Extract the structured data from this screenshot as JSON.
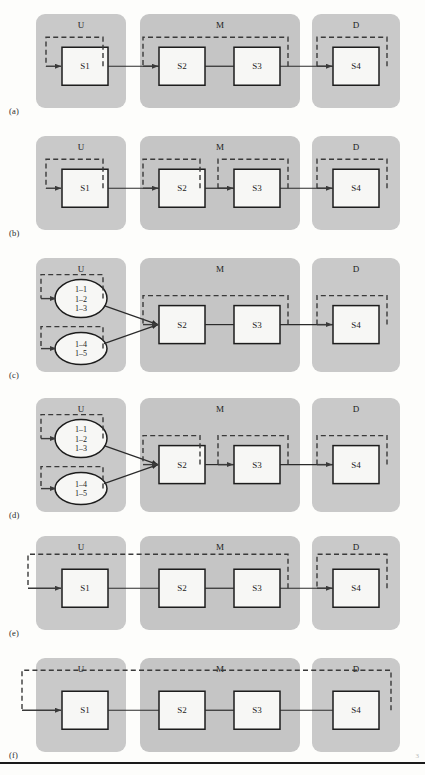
{
  "figure": {
    "width": 425,
    "height": 775,
    "stage_labels": [
      "U",
      "M",
      "D"
    ],
    "stage_label_names": {
      "U": "upstream",
      "M": "midstream",
      "D": "downstream"
    },
    "colors": {
      "stage_fill": "#c9c9c9",
      "stage_fill_alt": "#c5c5c5",
      "box_fill": "#f7f7f5",
      "box_stroke": "#1c1c1c",
      "dashed_stroke": "#3a3a3a",
      "flow_stroke": "#2b2b2b",
      "page_bg": "#fdfdfb",
      "text": "#222222"
    },
    "node_labels": [
      "S1",
      "S2",
      "S3",
      "S4"
    ],
    "cluster_labels_top": [
      "1–1",
      "1–2",
      "1–3"
    ],
    "cluster_labels_bottom": [
      "1–4",
      "1–5"
    ]
  },
  "panels": [
    {
      "id": "a",
      "label": "(a)",
      "node_type": "boxes",
      "nodes": [
        "S1",
        "S2",
        "S3",
        "S4"
      ],
      "loops": [
        "S1 self",
        "S2 through S3 span",
        "S4 self"
      ],
      "description": "Single loop over S1; one spanning loop across S2 and S3; single loop over S4"
    },
    {
      "id": "b",
      "label": "(b)",
      "node_type": "boxes",
      "nodes": [
        "S1",
        "S2",
        "S3",
        "S4"
      ],
      "loops": [
        "S1 self",
        "S2 self",
        "S3 self",
        "S4 self"
      ],
      "description": "Independent feedback loop over each of the four stages"
    },
    {
      "id": "c",
      "label": "(c)",
      "node_type": "clusters",
      "nodes": [
        "1–1",
        "1–2",
        "1–3",
        "1–4",
        "1–5",
        "S2",
        "S3",
        "S4"
      ],
      "loops": [
        "cluster 1 self",
        "cluster 2 self",
        "S2 through S3 span",
        "S4 self"
      ],
      "description": "Two upstream clusters feeding S2; spanning loop across S2 and S3; loop over S4"
    },
    {
      "id": "d",
      "label": "(d)",
      "node_type": "clusters",
      "nodes": [
        "1–1",
        "1–2",
        "1–3",
        "1–4",
        "1–5",
        "S2",
        "S3",
        "S4"
      ],
      "loops": [
        "cluster 1 self",
        "cluster 2 self",
        "S2 self",
        "S3 self",
        "S4 self"
      ],
      "description": "Two upstream clusters feeding S2; independent loops over S2, S3 and S4"
    },
    {
      "id": "e",
      "label": "(e)",
      "node_type": "boxes",
      "nodes": [
        "S1",
        "S2",
        "S3",
        "S4"
      ],
      "loops": [
        "S1 through S3 span",
        "S4 self"
      ],
      "description": "Long loop returning from S3 to S1; separate loop over S4"
    },
    {
      "id": "f",
      "label": "(f)",
      "node_type": "boxes",
      "nodes": [
        "S1",
        "S2",
        "S3",
        "S4"
      ],
      "loops": [
        "S1 through S4 global span"
      ],
      "description": "Single global loop returning from S4 all the way to S1"
    }
  ],
  "footer": {
    "mark": "3"
  }
}
